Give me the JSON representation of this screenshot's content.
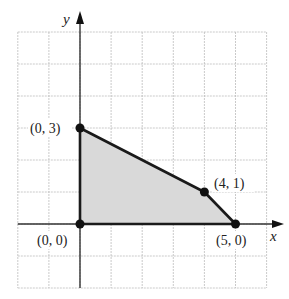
{
  "diagram": {
    "type": "coordinate-plane-feasible-region",
    "axes": {
      "x_label": "x",
      "y_label": "y",
      "grid_x_range": [
        -2,
        6
      ],
      "grid_y_range": [
        -2,
        6
      ]
    },
    "region": {
      "vertices": [
        [
          0,
          0
        ],
        [
          0,
          3
        ],
        [
          4,
          1
        ],
        [
          5,
          0
        ]
      ],
      "fill_color": "#d9d9d9",
      "edge_color": "#1a1a1a"
    },
    "points": [
      {
        "x": 0,
        "y": 3,
        "label": "(0, 3)"
      },
      {
        "x": 4,
        "y": 1,
        "label": "(4, 1)"
      },
      {
        "x": 0,
        "y": 0,
        "label": "(0, 0)"
      },
      {
        "x": 5,
        "y": 0,
        "label": "(5, 0)"
      }
    ],
    "colors": {
      "grid": "#bdbdbd",
      "axis": "#333333",
      "point": "#111111"
    }
  }
}
